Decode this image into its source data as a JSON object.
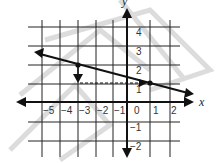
{
  "diagram": {
    "type": "coordinate-plane",
    "axes": {
      "x_label": "x",
      "y_label": "y"
    },
    "x_ticks": [
      "−5",
      "−4",
      "−3",
      "−2",
      "−1",
      "0",
      "1",
      "2"
    ],
    "y_ticks": [
      "4",
      "3",
      "2",
      "1",
      "−1",
      "−2"
    ],
    "line": {
      "from": [
        -5.6,
        2.8
      ],
      "to": [
        2.6,
        0.8
      ],
      "arrows": "both"
    },
    "points": [
      [
        -3.5,
        2.0
      ],
      [
        0.8,
        1.2
      ]
    ],
    "dashed_segment": {
      "from": [
        -3.5,
        1.2
      ],
      "to": [
        0.4,
        1.2
      ]
    },
    "down_arrow_at": [
      -3.5,
      1.5
    ],
    "colors": {
      "ink": "#111111",
      "grid": "#222222",
      "watermark": "#d0d0d0"
    }
  }
}
